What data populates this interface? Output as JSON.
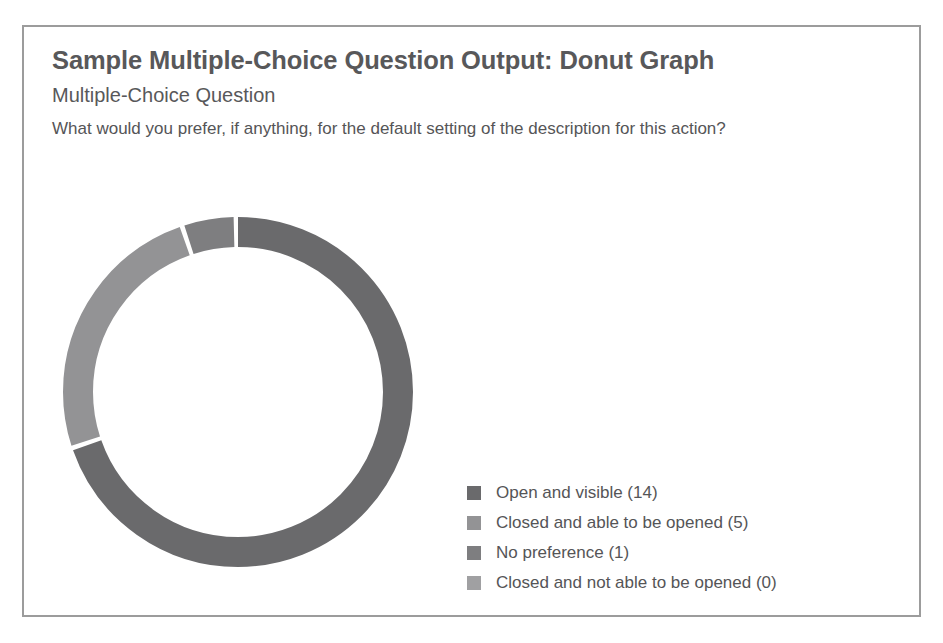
{
  "card": {
    "title": "Sample Multiple-Choice Question Output: Donut Graph",
    "subtitle": "Multiple-Choice Question",
    "question": "What would you prefer, if anything, for the default setting of the description for this action?"
  },
  "colors": {
    "title_text": "#58585a",
    "body_text": "#555557",
    "card_border": "#9c9c9c",
    "background": "#ffffff",
    "segment_1": "#6a6a6c",
    "segment_2": "#939395",
    "segment_3": "#7e7e80",
    "segment_4": "#a0a0a2"
  },
  "legend": {
    "items": [
      {
        "label": "Open and visible (14)",
        "color": "#6a6a6c",
        "swatch_name": "legend-swatch-open-and-visible"
      },
      {
        "label": "Closed and able to be opened (5)",
        "color": "#939395",
        "swatch_name": "legend-swatch-closed-able-to-be-opened"
      },
      {
        "label": "No preference (1)",
        "color": "#7e7e80",
        "swatch_name": "legend-swatch-no-preference"
      },
      {
        "label": "Closed and not able to be opened (0)",
        "color": "#a0a0a2",
        "swatch_name": "legend-swatch-closed-not-able-to-be-opened"
      }
    ]
  },
  "chart_data": {
    "type": "pie",
    "variant": "donut",
    "title": "Sample Multiple-Choice Question Output: Donut Graph",
    "subtitle": "Multiple-Choice Question",
    "question": "What would you prefer, if anything, for the default setting of the description for this action?",
    "categories": [
      "Open and visible",
      "Closed and able to be opened",
      "No preference",
      "Closed and not able to be opened"
    ],
    "values": [
      14,
      5,
      1,
      0
    ],
    "total": 20,
    "percentages": [
      70,
      25,
      5,
      0
    ],
    "colors": [
      "#6a6a6c",
      "#939395",
      "#7e7e80",
      "#a0a0a2"
    ],
    "legend_labels": [
      "Open and visible (14)",
      "Closed and able to be opened (5)",
      "No preference (1)",
      "Closed and not able to be opened (0)"
    ],
    "legend_position": "right",
    "start_angle_deg": 0,
    "direction": "clockwise",
    "inner_radius_ratio": 0.83,
    "grid": false,
    "xlabel": "",
    "ylabel": ""
  }
}
